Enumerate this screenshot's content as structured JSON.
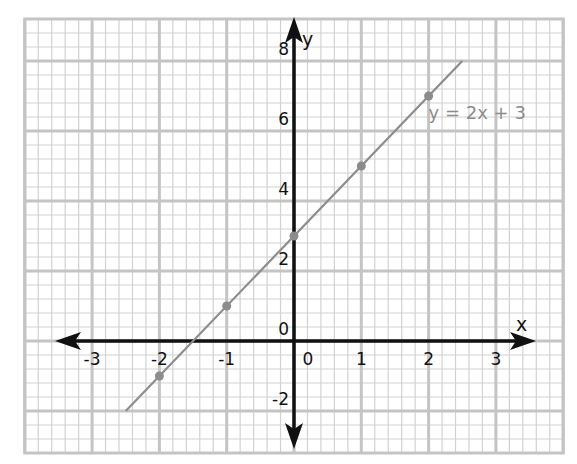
{
  "chart_data": {
    "type": "line",
    "title": "",
    "xlabel": "x",
    "ylabel": "y",
    "xlim": [
      -4,
      4
    ],
    "ylim": [
      -3.2,
      9.2
    ],
    "grid": true,
    "grid_minor_divisions_x": 5,
    "grid_minor_divisions_y": 5,
    "x_major_step": 1,
    "y_major_step": 2,
    "x_tick_labels": [
      "-3",
      "-2",
      "-1",
      "0",
      "1",
      "2",
      "3"
    ],
    "x_ticks": [
      -3,
      -2,
      -1,
      0,
      1,
      2,
      3
    ],
    "y_tick_labels": [
      "-2",
      "0",
      "2",
      "4",
      "6",
      "8"
    ],
    "y_ticks": [
      -2,
      0,
      2,
      4,
      6,
      8
    ],
    "series": [
      {
        "name": "y = 2x + 3",
        "equation": "y = 2x + 3",
        "slope": 2,
        "intercept": 3,
        "line_from": [
          -2.5,
          -2
        ],
        "line_to": [
          2.5,
          8
        ],
        "points": [
          {
            "x": -2,
            "y": -1
          },
          {
            "x": -1,
            "y": 1
          },
          {
            "x": 0,
            "y": 3
          },
          {
            "x": 1,
            "y": 5
          },
          {
            "x": 2,
            "y": 7
          }
        ],
        "color": "#8c8c8c"
      }
    ],
    "annotations": [
      {
        "text": "y = 2x + 3",
        "x": 2.0,
        "y": 6.4
      }
    ],
    "legend": "none"
  },
  "colors": {
    "grid_minor": "#d2d2d2",
    "grid_major": "#c4c4c4",
    "axis": "#111111",
    "series": "#8c8c8c"
  },
  "labels": {
    "x_axis": "x",
    "y_axis": "y",
    "equation": "y = 2x + 3"
  }
}
